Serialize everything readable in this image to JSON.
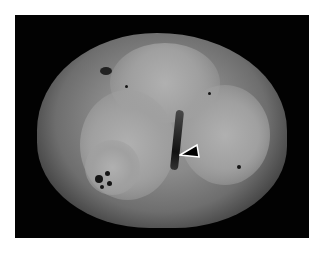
{
  "figure": {
    "annotation": {
      "type": "arrowhead",
      "color": "#000000",
      "outline": "#ffffff",
      "points_to": "central cleft"
    },
    "colors": {
      "background": "#ffffff",
      "photo_background": "#020202",
      "specimen_tone": "#9a9a9a"
    }
  }
}
